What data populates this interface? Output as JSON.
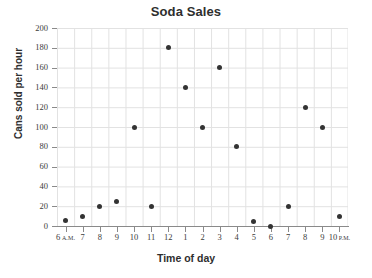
{
  "chart_data": {
    "type": "scatter",
    "title": "Soda Sales",
    "xlabel": "Time of day",
    "ylabel": "Cans sold per hour",
    "grid": true,
    "legend": false,
    "xlim": [
      0,
      16
    ],
    "ylim": [
      0,
      200
    ],
    "ytick_labels": [
      "200",
      "180",
      "160",
      "140",
      "120",
      "100",
      "80",
      "60",
      "40",
      "20",
      "0"
    ],
    "ytick_values": [
      200,
      180,
      160,
      140,
      120,
      100,
      80,
      60,
      40,
      20,
      0
    ],
    "xtick_labels": [
      {
        "hour": "6",
        "meridiem": "A.M."
      },
      {
        "hour": "7",
        "meridiem": ""
      },
      {
        "hour": "8",
        "meridiem": ""
      },
      {
        "hour": "9",
        "meridiem": ""
      },
      {
        "hour": "10",
        "meridiem": ""
      },
      {
        "hour": "11",
        "meridiem": ""
      },
      {
        "hour": "12",
        "meridiem": ""
      },
      {
        "hour": "1",
        "meridiem": ""
      },
      {
        "hour": "2",
        "meridiem": ""
      },
      {
        "hour": "3",
        "meridiem": ""
      },
      {
        "hour": "4",
        "meridiem": ""
      },
      {
        "hour": "5",
        "meridiem": ""
      },
      {
        "hour": "6",
        "meridiem": ""
      },
      {
        "hour": "7",
        "meridiem": ""
      },
      {
        "hour": "8",
        "meridiem": ""
      },
      {
        "hour": "9",
        "meridiem": ""
      },
      {
        "hour": "10",
        "meridiem": "P.M."
      }
    ],
    "categories": [
      "6 A.M.",
      "7 A.M.",
      "8 A.M.",
      "9 A.M.",
      "10 A.M.",
      "11 A.M.",
      "12 P.M.",
      "1 P.M.",
      "2 P.M.",
      "3 P.M.",
      "4 P.M.",
      "5 P.M.",
      "6 P.M.",
      "7 P.M.",
      "8 P.M.",
      "9 P.M.",
      "10 P.M."
    ],
    "values": [
      6,
      10,
      20,
      25,
      100,
      20,
      180,
      140,
      100,
      160,
      80,
      5,
      0,
      20,
      120,
      100,
      10
    ],
    "points": [
      {
        "x": 0,
        "y": 6
      },
      {
        "x": 1,
        "y": 10
      },
      {
        "x": 2,
        "y": 20
      },
      {
        "x": 3,
        "y": 25
      },
      {
        "x": 4,
        "y": 100
      },
      {
        "x": 5,
        "y": 20
      },
      {
        "x": 6,
        "y": 180
      },
      {
        "x": 7,
        "y": 140
      },
      {
        "x": 8,
        "y": 100
      },
      {
        "x": 9,
        "y": 160
      },
      {
        "x": 10,
        "y": 80
      },
      {
        "x": 11,
        "y": 5
      },
      {
        "x": 12,
        "y": 0
      },
      {
        "x": 13,
        "y": 20
      },
      {
        "x": 14,
        "y": 120
      },
      {
        "x": 15,
        "y": 100
      },
      {
        "x": 16,
        "y": 10
      }
    ],
    "colors": {
      "marker": "#333333",
      "grid": "#e2e2e2",
      "axis": "#8a8a8a",
      "text": "#3b3b3b",
      "background": "#ffffff"
    }
  }
}
